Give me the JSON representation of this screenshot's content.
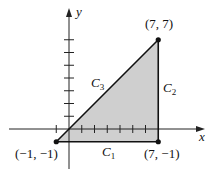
{
  "diagram": {
    "axes": {
      "x_label": "x",
      "y_label": "y"
    },
    "region_fill": "#cfcfcf",
    "vertices": [
      {
        "id": "A",
        "x": -1,
        "y": -1,
        "label": "(−1, −1)"
      },
      {
        "id": "B",
        "x": 7,
        "y": -1,
        "label": "(7, −1)"
      },
      {
        "id": "C",
        "x": 7,
        "y": 7,
        "label": "(7, 7)"
      }
    ],
    "curves": [
      {
        "name": "C",
        "sub": "1",
        "from": "A",
        "to": "B"
      },
      {
        "name": "C",
        "sub": "2",
        "from": "B",
        "to": "C"
      },
      {
        "name": "C",
        "sub": "3",
        "from": "C",
        "to": "A"
      }
    ],
    "x_ticks": [
      -1,
      1,
      2,
      3,
      4,
      5,
      6
    ],
    "y_ticks": [
      1,
      2,
      3,
      4,
      5,
      6,
      7
    ]
  }
}
